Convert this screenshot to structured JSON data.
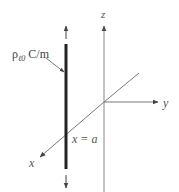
{
  "diagram": {
    "labels": {
      "charge_density_symbol": "ρ",
      "charge_density_subscript": "ℓ0",
      "charge_density_unit": " C/m",
      "z_axis": "z",
      "y_axis": "y",
      "x_axis": "x",
      "line_position": "x = a"
    },
    "colors": {
      "line_charge": "#222222",
      "axes": "#777777",
      "text": "#555555",
      "background": "#ffffff"
    },
    "elements": {
      "line_charge": {
        "x": 66,
        "y_top": 44,
        "y_bottom": 169,
        "width": 3
      },
      "z_axis": {
        "x": 104,
        "y_top": 25,
        "y_bottom": 192
      },
      "y_axis": {
        "x_start": 104,
        "x_end": 158,
        "y": 102
      },
      "x_axis": {
        "x_start": 139,
        "y_start": 73,
        "x_end": 40,
        "y_end": 157
      },
      "arrow_up": {
        "x": 66,
        "y_from": 39,
        "y_to": 25
      },
      "arrow_down": {
        "x": 66,
        "y_from": 175,
        "y_to": 188
      },
      "leader": {
        "x1": 46,
        "y1": 58,
        "x2": 64,
        "y2": 72
      }
    }
  }
}
